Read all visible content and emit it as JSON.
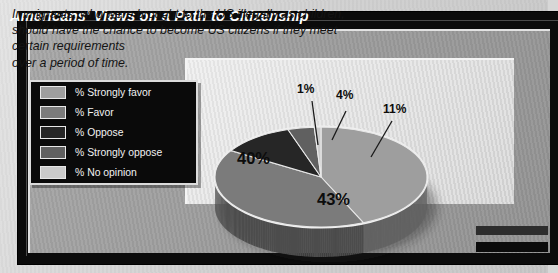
{
  "header": {
    "title": "Americans' Views on a Path to Citizenship"
  },
  "statement": {
    "lines": [
      "Immigrants, who were brought to the US illegally as children,",
      "should have the chance to become US citizens if they meet",
      "certain requirements",
      "over a period of time."
    ]
  },
  "legend": {
    "items": [
      {
        "label": "% Strongly favor",
        "color": "#9e9e9e"
      },
      {
        "label": "% Favor",
        "color": "#7b7b7b"
      },
      {
        "label": "% Oppose",
        "color": "#262626"
      },
      {
        "label": "% Strongly oppose",
        "color": "#606060"
      },
      {
        "label": "% No opinion",
        "color": "#cacaca"
      }
    ]
  },
  "labels": {
    "p1": "1%",
    "p4": "4%",
    "p11": "11%",
    "p40": "40%",
    "p43": "43%"
  },
  "colors": {
    "page_background": "#d7d7d7",
    "frame": "#0b0b0b",
    "panel": "#9c9c9c",
    "plot_area": "#e4e4e4",
    "title_text": "#ffffff",
    "statement_text": "#141414",
    "label_text": "#0c0c0c"
  },
  "chart_data": {
    "type": "pie",
    "title": "Americans' Views on a Path to Citizenship",
    "subtitle": "Immigrants, who were brought to the US illegally as children, should have the chance to become US citizens if they meet certain requirements over a period of time.",
    "unit": "percent",
    "legend_position": "left",
    "grid": false,
    "style": "3d-pie",
    "start_angle_deg": 0,
    "direction": "clockwise",
    "categories": [
      "% Strongly favor",
      "% Favor",
      "% Oppose",
      "% Strongly oppose",
      "% No opinion"
    ],
    "values": [
      43,
      40,
      11,
      4,
      1
    ],
    "slices": [
      {
        "label": "% Strongly favor",
        "value": 43,
        "display": "43%",
        "color": "#9e9e9e"
      },
      {
        "label": "% Favor",
        "value": 40,
        "display": "40%",
        "color": "#7b7b7b"
      },
      {
        "label": "% Oppose",
        "value": 11,
        "display": "11%",
        "color": "#262626"
      },
      {
        "label": "% Strongly oppose",
        "value": 4,
        "display": "4%",
        "color": "#606060"
      },
      {
        "label": "% No opinion",
        "value": 1,
        "display": "1%",
        "color": "#cacaca"
      }
    ],
    "total": 99
  }
}
